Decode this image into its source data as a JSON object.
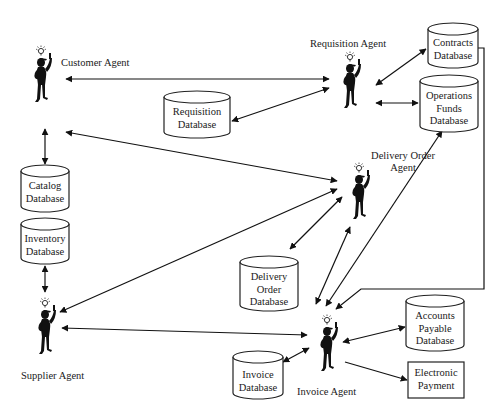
{
  "diagram": {
    "type": "multi-agent architecture",
    "agents": [
      {
        "id": "customer",
        "label": "Customer Agent"
      },
      {
        "id": "requisition",
        "label": "Requisition Agent"
      },
      {
        "id": "delivery_order",
        "label_line1": "Delivery Order",
        "label_line2": "Agent"
      },
      {
        "id": "supplier",
        "label": "Supplier Agent"
      },
      {
        "id": "invoice",
        "label": "Invoice Agent"
      }
    ],
    "databases": {
      "requisition": {
        "line1": "Requisition",
        "line2": "Database"
      },
      "contracts": {
        "line1": "Contracts",
        "line2": "Database"
      },
      "operations_funds": {
        "line1": "Operations",
        "line2": "Funds",
        "line3": "Database"
      },
      "catalog": {
        "line1": "Catalog",
        "line2": "Database"
      },
      "inventory": {
        "line1": "Inventory",
        "line2": "Database"
      },
      "delivery_order": {
        "line1": "Delivery",
        "line2": "Order",
        "line3": "Database"
      },
      "accounts_payable": {
        "line1": "Accounts",
        "line2": "Payable",
        "line3": "Database"
      },
      "invoice": {
        "line1": "Invoice",
        "line2": "Database"
      }
    },
    "boxes": {
      "electronic_payment": {
        "line1": "Electronic",
        "line2": "Payment"
      }
    },
    "connections": [
      {
        "from": "Customer Agent",
        "to": "Requisition Agent",
        "direction": "both"
      },
      {
        "from": "Requisition Database",
        "to": "Requisition Agent",
        "direction": "both"
      },
      {
        "from": "Requisition Agent",
        "to": "Contracts Database",
        "direction": "both"
      },
      {
        "from": "Requisition Agent",
        "to": "Operations Funds Database",
        "direction": "both"
      },
      {
        "from": "Customer Agent",
        "to": "Catalog Database",
        "direction": "both"
      },
      {
        "from": "Customer Agent",
        "to": "Delivery Order Agent",
        "direction": "both"
      },
      {
        "from": "Inventory Database",
        "to": "Supplier Agent",
        "direction": "both"
      },
      {
        "from": "Supplier Agent",
        "to": "Delivery Order Agent",
        "direction": "both"
      },
      {
        "from": "Delivery Order Agent",
        "to": "Delivery Order Database",
        "direction": "both"
      },
      {
        "from": "Delivery Order Agent",
        "to": "Invoice Agent",
        "direction": "both"
      },
      {
        "from": "Invoice Agent",
        "to": "Operations Funds Database",
        "direction": "both"
      },
      {
        "from": "Contracts Database",
        "to": "Invoice Agent",
        "direction": "to"
      },
      {
        "from": "Supplier Agent",
        "to": "Invoice Agent",
        "direction": "both"
      },
      {
        "from": "Invoice Database",
        "to": "Invoice Agent",
        "direction": "both"
      },
      {
        "from": "Invoice Agent",
        "to": "Accounts Payable Database",
        "direction": "both"
      },
      {
        "from": "Invoice Agent",
        "to": "Electronic Payment",
        "direction": "to"
      }
    ]
  }
}
